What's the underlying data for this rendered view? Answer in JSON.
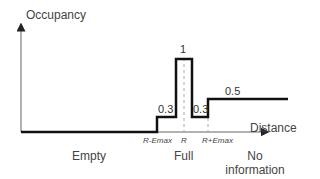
{
  "diagram": {
    "y_axis_label": "Occupancy",
    "x_axis_label": "Distance",
    "values": {
      "peak": "1",
      "pre_peak": "0.3",
      "post_peak": "0.3",
      "far": "0.5"
    },
    "ticks": {
      "r_minus_emax": "R-Emax",
      "r": "R",
      "r_plus_emax": "R+Emax"
    },
    "regions": {
      "empty": "Empty",
      "full": "Full",
      "no_info_line1": "No",
      "no_info_line2": "information"
    },
    "colors": {
      "profile": "#111111",
      "axis": "#999999",
      "dashed": "#aaaaaa"
    }
  }
}
